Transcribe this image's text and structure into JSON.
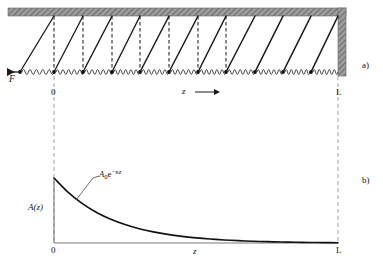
{
  "figure": {
    "panels": [
      {
        "tag": "a)",
        "description": "Chain of pendulums suspended from a hatched ceiling, connected by springs, driven by force F at the left end and terminated by a wall at z = L",
        "labels": {
          "force": "F",
          "origin": "0",
          "axis": "z",
          "axis_arrow": "⟶",
          "end": "L"
        }
      },
      {
        "tag": "b)",
        "description": "Amplitude profile A(z) decaying exponentially from z = 0 to z = L",
        "labels": {
          "ylabel": "A(z)",
          "origin": "0",
          "xlabel": "z",
          "end": "L",
          "curve_label_base": "A",
          "curve_label_sub": "0",
          "curve_label_e": "e",
          "curve_label_exp": "−κz"
        }
      }
    ],
    "colors": {
      "ink": "#1a1a1a",
      "ceiling": "#8f8f8f",
      "wall": "#8f8f8f",
      "axis": "#7a7a7a",
      "dash": "#9a9a9a",
      "curve": "#111111",
      "background": "#ffffff"
    }
  },
  "chart_data": {
    "type": "line",
    "xlabel": "z",
    "ylabel": "A(z)",
    "xlim": [
      0,
      1
    ],
    "ylim": [
      0,
      1
    ],
    "xtick_labels": [
      "0",
      "L"
    ],
    "grid": false,
    "legend": null,
    "annotations": [
      {
        "text": "A0e^(-κz)",
        "x": 0.13,
        "y": 0.78,
        "points_to_x": 0.075,
        "points_to_y": 0.55
      }
    ],
    "series": [
      {
        "name": "A0e^(-κz)",
        "decay_constant_kappa_times_L": 5.0,
        "x": [
          0,
          0.05,
          0.1,
          0.15,
          0.2,
          0.25,
          0.3,
          0.35,
          0.4,
          0.45,
          0.5,
          0.55,
          0.6,
          0.65,
          0.7,
          0.75,
          0.8,
          0.85,
          0.9,
          0.95,
          1.0
        ],
        "values": [
          1.0,
          0.779,
          0.607,
          0.472,
          0.368,
          0.287,
          0.223,
          0.174,
          0.135,
          0.105,
          0.082,
          0.064,
          0.05,
          0.039,
          0.03,
          0.024,
          0.018,
          0.014,
          0.011,
          0.009,
          0.007
        ]
      }
    ]
  },
  "pendulums": {
    "count": 11,
    "note": "Angular displacement from vertical decays exponentially along the chain; rods lean to the left near z = 0 and hang vertical near z = L",
    "x_positions": [
      20,
      54,
      83,
      112,
      140,
      169,
      198,
      226,
      255,
      283,
      311
    ],
    "tilt_offsets": [
      -34,
      -24,
      -17,
      -12,
      -8,
      -5.5,
      -3.5,
      -2,
      -1,
      -0.5,
      0
    ]
  }
}
